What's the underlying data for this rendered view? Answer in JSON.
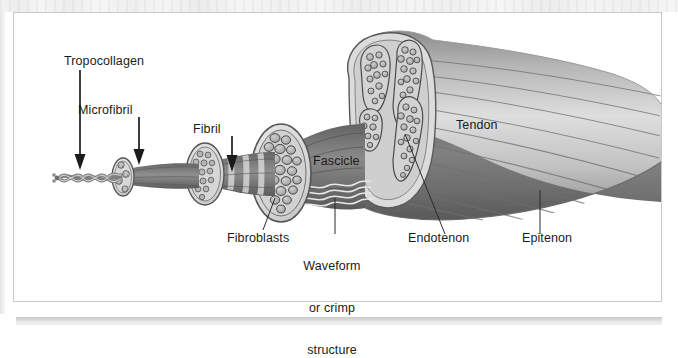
{
  "figure": {
    "type": "anatomical-diagram",
    "background_color": "#ffffff",
    "frame_color": "#c8c8c8",
    "ink_color": "#1b1b1b"
  },
  "labels": {
    "tropocollagen": "Tropocollagen",
    "microfibril": "Microfibril",
    "fibril": "Fibril",
    "fascicle": "Fascicle",
    "tendon": "Tendon",
    "fibroblasts": "Fibroblasts",
    "waveform_line1": "Waveform",
    "waveform_line2": "or crimp",
    "waveform_line3": "structure",
    "endotenon": "Endotenon",
    "epitenon": "Epitenon"
  },
  "structures": [
    {
      "name": "tropocollagen-helix",
      "label": "Tropocollagen",
      "pointer": "arrow"
    },
    {
      "name": "microfibril-bundle",
      "label": "Microfibril",
      "pointer": "arrow"
    },
    {
      "name": "fibril-banded-strand",
      "label": "Fibril",
      "pointer": "arrow"
    },
    {
      "name": "fascicle-cross-section",
      "label": "Fascicle",
      "pointer": "none"
    },
    {
      "name": "fibroblast-cells",
      "label": "Fibroblasts",
      "pointer": "leader-line"
    },
    {
      "name": "crimp-waveform",
      "label": "Waveform or crimp structure",
      "pointer": "leader-line"
    },
    {
      "name": "endotenon-septum",
      "label": "Endotenon",
      "pointer": "leader-line"
    },
    {
      "name": "epitenon-sheath",
      "label": "Epitenon",
      "pointer": "leader-line"
    },
    {
      "name": "tendon-body",
      "label": "Tendon",
      "pointer": "none"
    }
  ],
  "palette": {
    "sheath_light": "#d9d9d9",
    "sheath_mid": "#bdbdbd",
    "fiber_dark": "#6e6e6e",
    "fiber_darker": "#565656",
    "cell_fill": "#9a9a9a",
    "outline": "#3a3a3a",
    "tendon_light": "#ededed",
    "tendon_shadow": "#7d7d7d"
  }
}
